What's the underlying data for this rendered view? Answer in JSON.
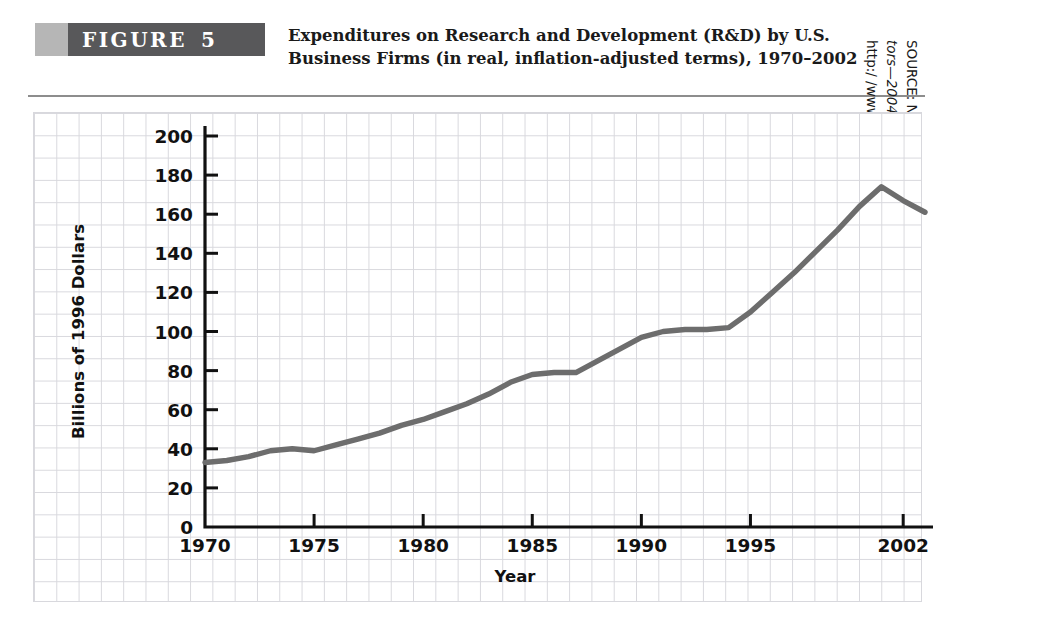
{
  "figure": {
    "banner_word": "FIGURE",
    "banner_number": "5",
    "caption_line1": "Expenditures on Research and Development (R&D) by U.S.",
    "caption_line2": "Business Firms (in real, inflation-adjusted terms), 1970–2002",
    "banner_light_color": "#b6b6b6",
    "banner_dark_color": "#58585a",
    "rule_color": "#8d8d8d"
  },
  "source": {
    "line1_prefix": "SOURCE: National Science Board, ",
    "line1_italic": "Science and Engineering Indica-",
    "line2_italic": "tors—2004",
    "line2_rest": ", Arlington, VA.: National Science Foundation, 2004,",
    "line3": "http:/ /www.nsf.gov."
  },
  "chart_data": {
    "type": "line",
    "title": "Expenditures on Research and Development (R&D) by U.S. Business Firms (in real, inflation-adjusted terms), 1970–2002",
    "xlabel": "Year",
    "ylabel": "Billions of 1996 Dollars",
    "xlim": [
      1970,
      2003
    ],
    "ylim": [
      0,
      200
    ],
    "ytick_values": [
      0,
      20,
      40,
      60,
      80,
      100,
      120,
      140,
      160,
      180,
      200
    ],
    "ytick_labels": [
      "0",
      "20",
      "40",
      "60",
      "80",
      "100",
      "120",
      "140",
      "160",
      "180",
      "200"
    ],
    "xtick_values": [
      1970,
      1975,
      1980,
      1985,
      1990,
      1995,
      2002
    ],
    "xtick_labels": [
      "1970",
      "1975",
      "1980",
      "1985",
      "1990",
      "1995",
      "2002"
    ],
    "grid": true,
    "legend": false,
    "line_color": "#6d6d6d",
    "series": [
      {
        "name": "R&D expenditures by U.S. business firms",
        "x": [
          1970,
          1971,
          1972,
          1973,
          1974,
          1975,
          1976,
          1977,
          1978,
          1979,
          1980,
          1981,
          1982,
          1983,
          1984,
          1985,
          1986,
          1987,
          1988,
          1989,
          1990,
          1991,
          1992,
          1993,
          1994,
          1995,
          1996,
          1997,
          1998,
          1999,
          2000,
          2001,
          2002,
          2003
        ],
        "values": [
          33,
          34,
          36,
          39,
          40,
          39,
          42,
          45,
          48,
          52,
          55,
          59,
          63,
          68,
          74,
          78,
          79,
          79,
          85,
          91,
          97,
          100,
          101,
          101,
          102,
          110,
          120,
          130,
          141,
          152,
          164,
          174,
          167,
          161
        ]
      }
    ]
  }
}
